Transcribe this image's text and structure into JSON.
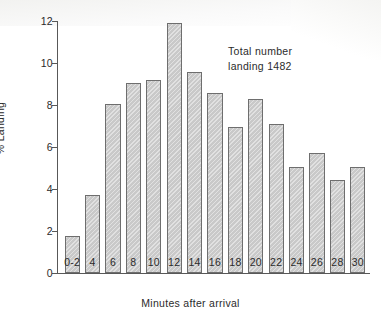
{
  "chart_data": {
    "type": "bar",
    "title": "",
    "xlabel": "Minutes after arrival",
    "ylabel": "% Landing",
    "categories": [
      "0-2",
      "4",
      "6",
      "8",
      "10",
      "12",
      "14",
      "16",
      "18",
      "20",
      "22",
      "24",
      "26",
      "28",
      "30"
    ],
    "values": [
      1.75,
      3.7,
      8.05,
      9.05,
      9.2,
      11.9,
      9.55,
      8.55,
      6.95,
      8.3,
      7.1,
      5.05,
      5.7,
      4.45,
      5.05
    ],
    "ylim": [
      0,
      12
    ],
    "yticks": [
      0,
      2,
      4,
      6,
      8,
      10,
      12
    ],
    "ytick_labels": [
      "0",
      "2",
      "4",
      "6",
      "8",
      "10",
      "12"
    ],
    "grid": false,
    "legend": "none",
    "annotations": [
      {
        "line1": "Total number",
        "line2": "landing 1482"
      }
    ],
    "bar_fill_color": "#c9c9c9",
    "bar_edge_color": "#6e6e6e",
    "axis_color": "#585858",
    "background_color": "#ffffff"
  }
}
